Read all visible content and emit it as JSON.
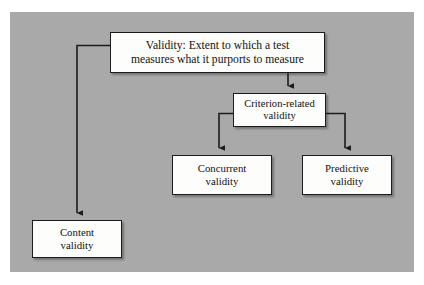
{
  "figure": {
    "panel_color": "#a9a9a9",
    "box_fill": "#fdfdfb",
    "line_color": "#1c1c1c"
  },
  "nodes": {
    "root": {
      "label": "Validity:  Extent to which a test\nmeasures what it purports to measure",
      "name": "validity-definition"
    },
    "criterion": {
      "label": "Criterion-related\nvalidity",
      "name": "criterion-related-validity"
    },
    "concurrent": {
      "label": "Concurrent\nvalidity",
      "name": "concurrent-validity"
    },
    "predictive": {
      "label": "Predictive\nvalidity",
      "name": "predictive-validity"
    },
    "content": {
      "label": "Content\nvalidity",
      "name": "content-validity"
    }
  },
  "connectors": [
    {
      "from": "root",
      "to": "content",
      "style": "elbow-left-down",
      "arrow": "down"
    },
    {
      "from": "root",
      "to": "criterion",
      "style": "straight-down",
      "arrow": "down"
    },
    {
      "from": "criterion",
      "to": "concurrent",
      "style": "elbow-left-down",
      "arrow": "down"
    },
    {
      "from": "criterion",
      "to": "predictive",
      "style": "elbow-right-down",
      "arrow": "down"
    }
  ]
}
